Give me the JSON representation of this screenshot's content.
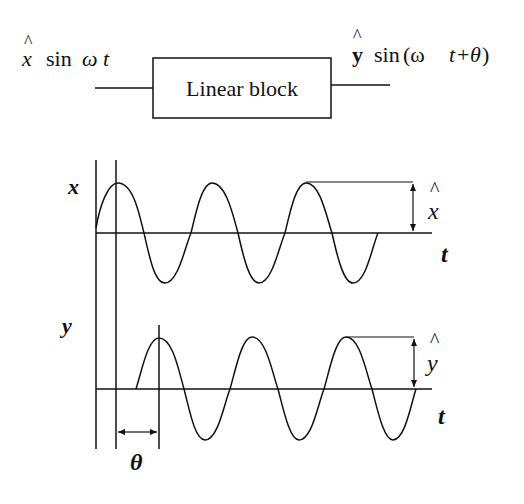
{
  "block_diagram": {
    "input_label": {
      "amp": "x",
      "hat": "^",
      "func": "sin",
      "arg": "ω t"
    },
    "block_label": "Linear block",
    "output_label": {
      "amp": "y",
      "hat": "^",
      "func": "sin",
      "arg_open": "(ω ",
      "arg_t": "t",
      "arg_plus": "+",
      "arg_theta": "θ",
      "arg_close": ")"
    }
  },
  "waveforms": {
    "top": {
      "axis_label": "x",
      "time_label": "t",
      "amplitude_label": "x",
      "amplitude_hat": "^"
    },
    "bottom": {
      "axis_label": "y",
      "time_label": "t",
      "amplitude_label": "y",
      "amplitude_hat": "^"
    },
    "phase_label": "θ"
  },
  "colors": {
    "ink": "#111111",
    "background": "#ffffff"
  }
}
